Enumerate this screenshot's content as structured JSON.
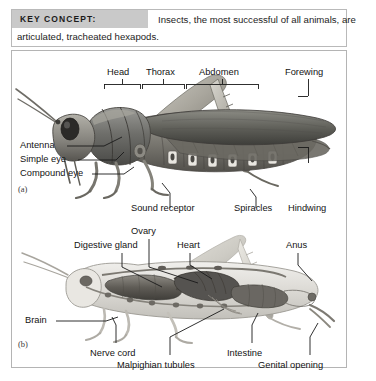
{
  "header": {
    "badge_label": "KEY CONCEPT:",
    "line1": "Insects, the most successful of all animals, are",
    "line2": "articulated, tracheated hexapods."
  },
  "figure": {
    "panel_a": {
      "tag": "(a)",
      "caption_type": "external anatomy of a grasshopper",
      "labels": {
        "head": "Head",
        "thorax": "Thorax",
        "abdomen": "Abdomen",
        "forewing": "Forewing",
        "antenna": "Antenna",
        "simple_eye": "Simple eye",
        "compound_eye": "Compound eye",
        "sound_receptor": "Sound receptor",
        "spiracles": "Spiracles",
        "hindwing": "Hindwing"
      }
    },
    "panel_b": {
      "tag": "(b)",
      "caption_type": "internal anatomy of a grasshopper",
      "labels": {
        "ovary": "Ovary",
        "digestive_gland": "Digestive gland",
        "heart": "Heart",
        "anus": "Anus",
        "brain": "Brain",
        "nerve_cord": "Nerve cord",
        "malpighian_tubules": "Malpighian tubules",
        "intestine": "Intestine",
        "genital_opening": "Genital opening"
      }
    }
  },
  "colors": {
    "badge_bg": "#c9c9c9",
    "frame_border": "#b4b4b4",
    "text": "#131313",
    "leader_line": "#1a1a1a"
  }
}
